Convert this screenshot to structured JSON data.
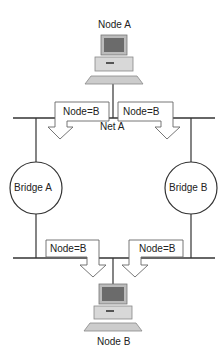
{
  "diagram": {
    "type": "transparent-bridge-network",
    "nodes": [
      {
        "id": "node_a",
        "label": "Node A",
        "kind": "computer",
        "position": "top"
      },
      {
        "id": "node_b",
        "label": "Node B",
        "kind": "computer",
        "position": "bottom"
      }
    ],
    "networks": [
      {
        "id": "net_a",
        "label": "Net A"
      },
      {
        "id": "net_b",
        "label": ""
      }
    ],
    "bridges": [
      {
        "id": "bridge_a",
        "label": "Bridge A",
        "side": "left"
      },
      {
        "id": "bridge_b",
        "label": "Bridge B",
        "side": "right"
      }
    ],
    "frames": [
      {
        "id": "frame_top_left",
        "label": "Node=B",
        "on": "net_a",
        "direction": "down-left"
      },
      {
        "id": "frame_top_right",
        "label": "Node=B",
        "on": "net_a",
        "direction": "down-right"
      },
      {
        "id": "frame_bottom_left",
        "label": "Node=B",
        "on": "net_b",
        "direction": "down"
      },
      {
        "id": "frame_bottom_right",
        "label": "Node=B",
        "on": "net_b",
        "direction": "down"
      }
    ],
    "colors": {
      "line": "#333333",
      "frame": "#555555",
      "computer_body": "#d8d8d8",
      "screen": "#6b6b6b"
    }
  }
}
